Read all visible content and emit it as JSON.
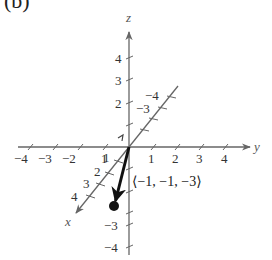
{
  "panel_label": "(b)",
  "axes": {
    "x": {
      "name": "x",
      "ticks": [
        "1",
        "2",
        "3",
        "4",
        "−3",
        "−4"
      ]
    },
    "y": {
      "name": "y",
      "ticks": [
        "−4",
        "−3",
        "−2",
        "1",
        "1",
        "2",
        "3",
        "4"
      ]
    },
    "z": {
      "name": "z",
      "ticks": [
        "4",
        "3",
        "2",
        "−3",
        "−4"
      ]
    }
  },
  "vector": {
    "label": "⟨−1, −1, −3⟩",
    "components": [
      -1,
      -1,
      -3
    ]
  },
  "colors": {
    "axis": "#666666",
    "vector": "#111111",
    "text": "#333333"
  }
}
